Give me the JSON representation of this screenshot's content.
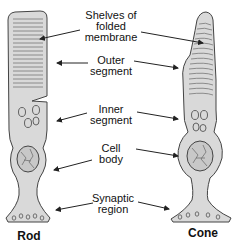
{
  "diagram": {
    "colors": {
      "cell_fill": "#d9d9d9",
      "outline": "#444444",
      "text": "#111111",
      "background": "#ffffff"
    },
    "labels": [
      {
        "id": "shelves",
        "text": "Shelves of\nfolded\nmembrane"
      },
      {
        "id": "outer",
        "text": "Outer\nsegment"
      },
      {
        "id": "inner",
        "text": "Inner\nsegment"
      },
      {
        "id": "cellbody",
        "text": "Cell\nbody"
      },
      {
        "id": "synaptic",
        "text": "Synaptic\nregion"
      }
    ],
    "cells": [
      {
        "id": "rod",
        "name": "Rod"
      },
      {
        "id": "cone",
        "name": "Cone"
      }
    ]
  }
}
